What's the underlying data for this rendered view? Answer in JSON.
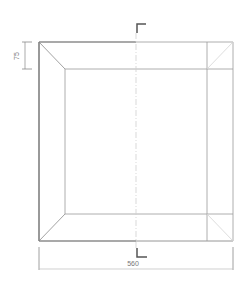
{
  "diagram": {
    "type": "frame-elevation",
    "colors": {
      "outline_dark": "#555555",
      "outline_light": "#9a9a9a",
      "dimension": "#888888",
      "section_marker": "#555555",
      "centerline": "#cfcfcf",
      "background": "#ffffff"
    },
    "dimensions": {
      "rail_width": "75",
      "overall_width": "560"
    },
    "section_marker": {
      "label": ""
    }
  }
}
